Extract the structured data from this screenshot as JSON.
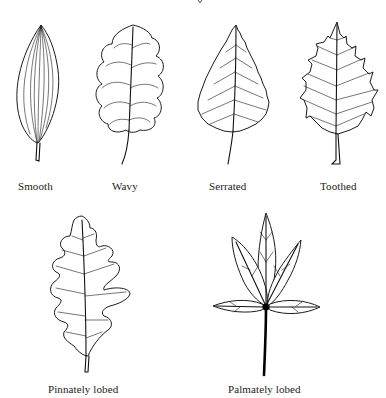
{
  "figure": {
    "title_fragment": "y",
    "top_row": [
      {
        "label": "Smooth"
      },
      {
        "label": "Wavy"
      },
      {
        "label": "Serrated"
      },
      {
        "label": "Toothed"
      }
    ],
    "bottom_row": [
      {
        "label": "Pinnately lobed"
      },
      {
        "label": "Palmately lobed"
      }
    ]
  },
  "colors": {
    "background": "#ffffff",
    "ink": "#1a1a1a"
  }
}
